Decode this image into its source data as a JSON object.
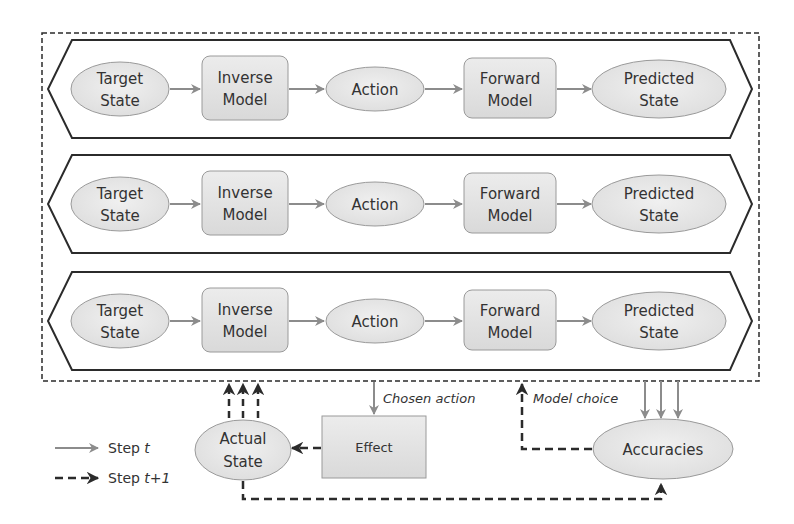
{
  "diagram": {
    "rows": [
      {
        "target_state": [
          "Target",
          "State"
        ],
        "inverse_model": [
          "Inverse",
          "Model"
        ],
        "action": "Action",
        "forward_model": [
          "Forward",
          "Model"
        ],
        "predicted_state": [
          "Predicted",
          "State"
        ]
      },
      {
        "target_state": [
          "Target",
          "State"
        ],
        "inverse_model": [
          "Inverse",
          "Model"
        ],
        "action": "Action",
        "forward_model": [
          "Forward",
          "Model"
        ],
        "predicted_state": [
          "Predicted",
          "State"
        ]
      },
      {
        "target_state": [
          "Target",
          "State"
        ],
        "inverse_model": [
          "Inverse",
          "Model"
        ],
        "action": "Action",
        "forward_model": [
          "Forward",
          "Model"
        ],
        "predicted_state": [
          "Predicted",
          "State"
        ]
      }
    ],
    "actual_state": [
      "Actual",
      "State"
    ],
    "effect": "Effect",
    "accuracies": "Accuracies",
    "chosen_action_label": "Chosen action",
    "model_choice_label": "Model choice",
    "legend": {
      "step_t": {
        "text": "Step ",
        "var": "t"
      },
      "step_t1": {
        "text": "Step ",
        "var": "t+1"
      }
    },
    "colors": {
      "node_fill": "#e6e6e6",
      "node_stroke": "#9a9a9a",
      "arrow_gray": "#8c8c8c",
      "line_dark": "#2b2b2b"
    }
  }
}
